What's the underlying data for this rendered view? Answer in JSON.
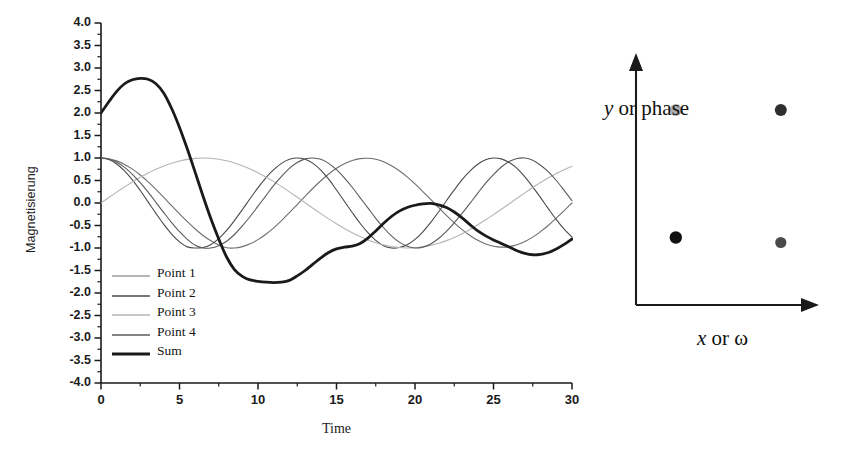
{
  "figure": {
    "background": "#ffffff"
  },
  "chart_data": {
    "type": "line",
    "title": "",
    "xlabel": "Time",
    "ylabel": "Magnetisierung",
    "xlim": [
      0,
      30
    ],
    "ylim": [
      -4.0,
      4.0
    ],
    "grid": false,
    "legend_position": "inside-lower-left",
    "x_ticks": [
      0,
      5,
      10,
      15,
      20,
      25,
      30
    ],
    "x_tick_labels": [
      "0",
      "5",
      "10",
      "15",
      "20",
      "25",
      "30"
    ],
    "x_minor_step": 2.5,
    "y_ticks": [
      -4.0,
      -3.5,
      -3.0,
      -2.5,
      -2.0,
      -1.5,
      -1.0,
      -0.5,
      0.0,
      0.5,
      1.0,
      1.5,
      2.0,
      2.5,
      3.0,
      3.5,
      4.0
    ],
    "y_tick_labels": [
      "-4.0",
      "-3.5",
      "-3.0",
      "-2.5",
      "-2.0",
      "-1.5",
      "-1.0",
      "-0.5",
      "0.0",
      "0.5",
      "1.0",
      "1.5",
      "2.0",
      "2.5",
      "3.0",
      "3.5",
      "4.0"
    ],
    "x": [
      0,
      0.5,
      1,
      1.5,
      2,
      2.5,
      3,
      3.5,
      4,
      4.5,
      5,
      5.5,
      6,
      6.5,
      7,
      7.5,
      8,
      8.5,
      9,
      9.5,
      10,
      10.5,
      11,
      11.5,
      12,
      12.5,
      13,
      13.5,
      14,
      14.5,
      15,
      15.5,
      16,
      16.5,
      17,
      17.5,
      18,
      18.5,
      19,
      19.5,
      20,
      20.5,
      21,
      21.5,
      22,
      22.5,
      23,
      23.5,
      24,
      24.5,
      25,
      25.5,
      26,
      26.5,
      27,
      27.5,
      28,
      28.5,
      29,
      29.5,
      30
    ],
    "series": [
      {
        "name": "Point 1",
        "color": "#6e6e6e",
        "width": 1.1,
        "amplitude": 1.0,
        "angular_frequency": 0.36,
        "phase": 0.0,
        "values": [
          1.0,
          0.984,
          0.936,
          0.858,
          0.753,
          0.622,
          0.471,
          0.303,
          0.124,
          -0.06,
          -0.242,
          -0.416,
          -0.578,
          -0.721,
          -0.841,
          -0.933,
          -0.995,
          -1.0,
          -0.969,
          -0.906,
          -0.814,
          -0.694,
          -0.551,
          -0.39,
          -0.216,
          -0.034,
          0.149,
          0.328,
          0.495,
          0.645,
          0.773,
          0.874,
          0.946,
          0.987,
          0.995,
          0.971,
          0.915,
          0.829,
          0.716,
          0.579,
          0.424,
          0.255,
          0.079,
          -0.1,
          -0.275,
          -0.44,
          -0.591,
          -0.722,
          -0.829,
          -0.909,
          -0.96,
          -0.98,
          -0.969,
          -0.927,
          -0.856,
          -0.758,
          -0.636,
          -0.494,
          -0.337,
          -0.171,
          0.0
        ]
      },
      {
        "name": "Point 2",
        "color": "#4a4a4a",
        "width": 1.1,
        "amplitude": 1.0,
        "angular_frequency": 0.52,
        "phase": 0.0,
        "values": [
          1.0,
          0.966,
          0.868,
          0.713,
          0.512,
          0.277,
          0.024,
          -0.232,
          -0.475,
          -0.69,
          -0.863,
          -0.975,
          -1.0,
          -0.99,
          -0.92,
          -0.79,
          -0.61,
          -0.39,
          -0.15,
          0.1,
          0.34,
          0.56,
          0.74,
          0.88,
          0.97,
          1.0,
          0.97,
          0.88,
          0.73,
          0.53,
          0.29,
          0.04,
          -0.21,
          -0.45,
          -0.66,
          -0.83,
          -0.95,
          -1.0,
          -0.99,
          -0.93,
          -0.81,
          -0.64,
          -0.43,
          -0.2,
          0.05,
          0.29,
          0.52,
          0.71,
          0.86,
          0.96,
          1.0,
          0.98,
          0.9,
          0.77,
          0.58,
          0.36,
          0.12,
          -0.13,
          -0.37,
          -0.58,
          -0.76
        ]
      },
      {
        "name": "Point 3",
        "color": "#b5b5b5",
        "width": 1.1,
        "amplitude": 1.0,
        "angular_frequency": 0.245,
        "phase": -1.5708,
        "values": [
          0.0,
          0.122,
          0.242,
          0.357,
          0.468,
          0.571,
          0.666,
          0.75,
          0.824,
          0.885,
          0.934,
          0.969,
          0.991,
          0.999,
          0.993,
          0.973,
          0.938,
          0.891,
          0.83,
          0.757,
          0.673,
          0.578,
          0.475,
          0.364,
          0.248,
          0.128,
          0.006,
          -0.116,
          -0.236,
          -0.352,
          -0.463,
          -0.567,
          -0.662,
          -0.747,
          -0.821,
          -0.882,
          -0.931,
          -0.967,
          -0.99,
          -0.999,
          -0.994,
          -0.975,
          -0.942,
          -0.896,
          -0.836,
          -0.764,
          -0.681,
          -0.587,
          -0.484,
          -0.374,
          -0.259,
          -0.139,
          -0.017,
          0.105,
          0.226,
          0.343,
          0.455,
          0.559,
          0.655,
          0.741,
          0.815
        ]
      },
      {
        "name": "Point 4",
        "color": "#5a5a5a",
        "width": 1.1,
        "amplitude": 1.0,
        "angular_frequency": 0.44,
        "phase": 0.0,
        "values": [
          1.0,
          0.976,
          0.905,
          0.791,
          0.637,
          0.451,
          0.24,
          0.015,
          -0.215,
          -0.436,
          -0.637,
          -0.808,
          -0.94,
          -1.0,
          -1.0,
          -0.95,
          -0.85,
          -0.7,
          -0.51,
          -0.3,
          -0.07,
          0.16,
          0.39,
          0.59,
          0.77,
          0.9,
          0.98,
          1.0,
          0.97,
          0.88,
          0.74,
          0.56,
          0.35,
          0.12,
          -0.11,
          -0.34,
          -0.55,
          -0.73,
          -0.87,
          -0.96,
          -1.0,
          -0.98,
          -0.91,
          -0.79,
          -0.63,
          -0.44,
          -0.23,
          -0.01,
          0.22,
          0.44,
          0.63,
          0.8,
          0.92,
          0.99,
          1.0,
          0.95,
          0.84,
          0.69,
          0.5,
          0.28,
          0.05
        ]
      },
      {
        "name": "Sum",
        "color": "#1a1a1a",
        "width": 2.8,
        "is_sum": true,
        "values": [
          2.0,
          2.25,
          2.48,
          2.65,
          2.74,
          2.77,
          2.75,
          2.65,
          2.44,
          2.1,
          1.68,
          1.2,
          0.68,
          0.15,
          -0.35,
          -0.8,
          -1.2,
          -1.48,
          -1.63,
          -1.71,
          -1.74,
          -1.76,
          -1.77,
          -1.76,
          -1.72,
          -1.62,
          -1.5,
          -1.36,
          -1.22,
          -1.1,
          -1.02,
          -0.98,
          -0.96,
          -0.9,
          -0.78,
          -0.62,
          -0.45,
          -0.3,
          -0.18,
          -0.1,
          -0.05,
          -0.02,
          -0.01,
          -0.04,
          -0.1,
          -0.2,
          -0.33,
          -0.48,
          -0.62,
          -0.73,
          -0.82,
          -0.9,
          -0.98,
          -1.06,
          -1.12,
          -1.15,
          -1.14,
          -1.1,
          -1.02,
          -0.92,
          -0.8
        ]
      }
    ]
  },
  "legend": {
    "entries": [
      {
        "label": "Point 1",
        "color": "#6e6e6e",
        "width": 1.2
      },
      {
        "label": "Point 2",
        "color": "#4a4a4a",
        "width": 1.3
      },
      {
        "label": "Point 3",
        "color": "#b5b5b5",
        "width": 1.3
      },
      {
        "label": "Point 4",
        "color": "#5a5a5a",
        "width": 1.3
      },
      {
        "label": "Sum",
        "color": "#1a1a1a",
        "width": 3.2
      }
    ]
  },
  "diagram": {
    "y_axis_label_italic": "y",
    "y_axis_label_rest": " or phase",
    "x_axis_label_italic": "x",
    "x_axis_label_rest": " or ω",
    "axis_color": "#1a1a1a",
    "points": [
      {
        "name": "point-3-marker",
        "x": 0.22,
        "y": 0.78,
        "color": "#aeaeae",
        "radius": 6.0
      },
      {
        "name": "point-2-marker",
        "x": 0.8,
        "y": 0.78,
        "color": "#2e2e2e",
        "radius": 6.0
      },
      {
        "name": "point-1-marker",
        "x": 0.22,
        "y": 0.27,
        "color": "#111111",
        "radius": 6.2
      },
      {
        "name": "point-4-marker",
        "x": 0.8,
        "y": 0.25,
        "color": "#4a4a4a",
        "radius": 5.6
      }
    ]
  }
}
